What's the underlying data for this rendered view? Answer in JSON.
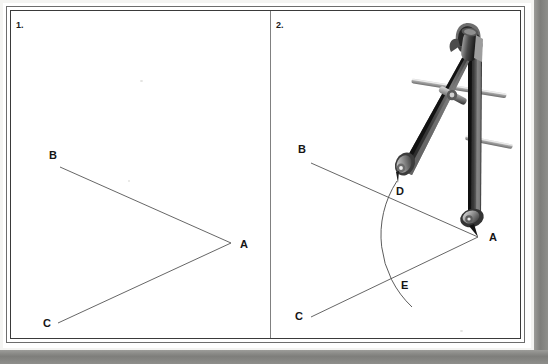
{
  "document": {
    "type": "scanned-geometry-worksheet",
    "width": 548,
    "height": 364,
    "background": "#ffffff",
    "frame_color": "#3a3a3a",
    "shadow_color": "#7e7e7b"
  },
  "panels": [
    {
      "id": "panel-1",
      "number_label": "1.",
      "caption": "Given angle BAC",
      "points": [
        {
          "name": "A",
          "label": "A",
          "x": 231,
          "y": 243,
          "label_x": 240,
          "label_y": 239
        },
        {
          "name": "B",
          "label": "B",
          "x": 60,
          "y": 167,
          "label_x": 49,
          "label_y": 150
        },
        {
          "name": "C",
          "label": "C",
          "x": 58,
          "y": 323,
          "label_x": 43,
          "label_y": 318
        }
      ],
      "rays": [
        {
          "name": "ray-AB",
          "from": "A",
          "to": "B"
        },
        {
          "name": "ray-AC",
          "from": "A",
          "to": "C"
        }
      ],
      "arc": null,
      "compass": false
    },
    {
      "id": "panel-2",
      "number_label": "2.",
      "caption": "Arc drawn from vertex A cutting the rays at D and E",
      "points": [
        {
          "name": "A",
          "label": "A",
          "x": 478,
          "y": 237,
          "label_x": 489,
          "label_y": 232
        },
        {
          "name": "B",
          "label": "B",
          "x": 311,
          "y": 163,
          "label_x": 299,
          "label_y": 144
        },
        {
          "name": "C",
          "label": "C",
          "x": 311,
          "y": 317,
          "label_x": 296,
          "label_y": 311
        },
        {
          "name": "D",
          "label": "D",
          "x": 387,
          "y": 197,
          "label_x": 396,
          "label_y": 186
        },
        {
          "name": "E",
          "label": "E",
          "x": 391,
          "y": 290,
          "label_x": 401,
          "label_y": 280
        }
      ],
      "rays": [
        {
          "name": "ray-AB",
          "from": "A",
          "to": "B"
        },
        {
          "name": "ray-AC",
          "from": "A",
          "to": "C"
        }
      ],
      "arc": {
        "name": "compass-arc",
        "center": "A",
        "radius": 97,
        "start_x": 397,
        "start_y": 181,
        "end_x": 412,
        "end_y": 307,
        "color": "#4d4d4d"
      },
      "compass": true
    }
  ],
  "compass_tool": {
    "name": "drawing-compass",
    "pencil_tip": {
      "x": 398,
      "y": 183
    },
    "needle_tip": {
      "x": 478,
      "y": 237
    },
    "hinge": {
      "x": 474,
      "y": 55
    },
    "body_color": "#2f2f2f",
    "metal_color": "#b9b9b9",
    "highlight_color": "#efefef",
    "parts": [
      "hinge-knob",
      "pencil-leg",
      "needle-leg",
      "cross-bar-upper",
      "cross-bar-lower",
      "adjust-screw",
      "pencil-clamp",
      "needle-clamp"
    ]
  }
}
